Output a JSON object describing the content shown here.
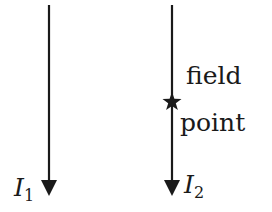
{
  "diagram": {
    "type": "two parallel current-carrying wires",
    "wires": [
      {
        "id": "wire-1",
        "label": "I",
        "subscript": "1",
        "direction": "down"
      },
      {
        "id": "wire-2",
        "label": "I",
        "subscript": "2",
        "direction": "down"
      }
    ],
    "field_point": {
      "marker": "star",
      "label_line1": "field",
      "label_line2": "point",
      "on_wire": "wire-2"
    },
    "colors": {
      "line": "#1a1a1a",
      "background": "#ffffff"
    }
  }
}
